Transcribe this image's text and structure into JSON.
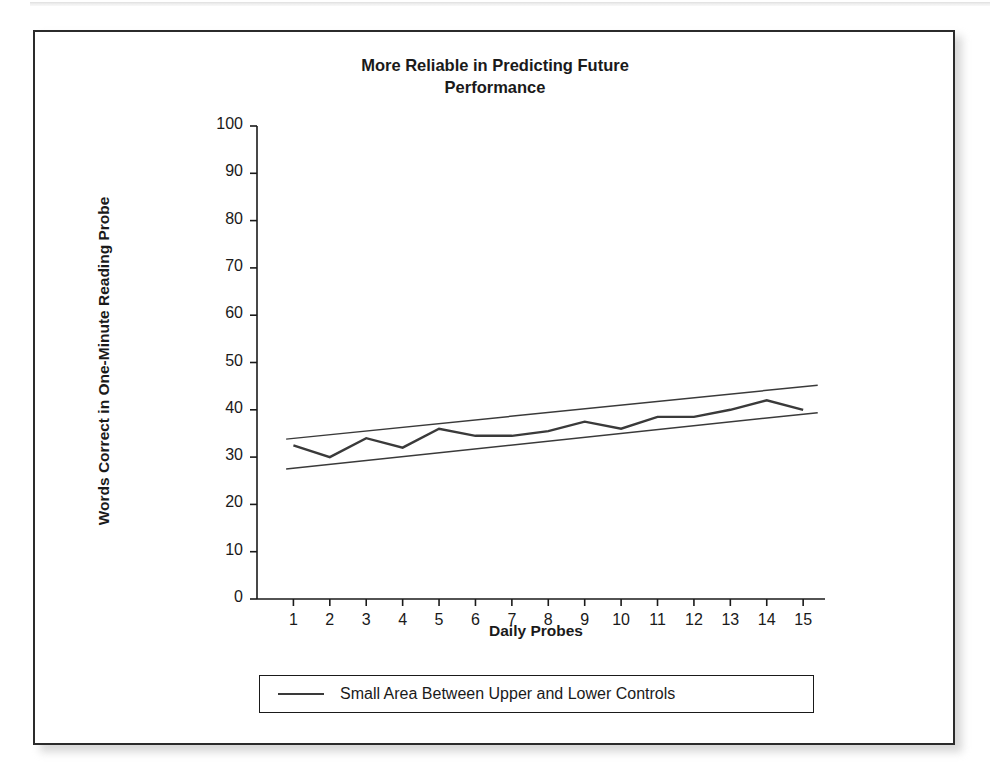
{
  "figure": {
    "title_line1": "More Reliable in Predicting Future",
    "title_line2": "Performance",
    "border_color": "#2b2b2b",
    "background": "#ffffff"
  },
  "legend": {
    "entries": [
      {
        "label": "Small Area Between Upper and Lower Controls",
        "marker": "line",
        "color": "#3a3a3a"
      }
    ]
  },
  "chart_data": {
    "type": "line",
    "title": "More Reliable in Predicting Future Performance",
    "xlabel": "Daily Probes",
    "ylabel": "Words Correct in One-Minute Reading Probe",
    "xlim": [
      0,
      15.6
    ],
    "ylim": [
      0,
      100
    ],
    "xticks": [
      1,
      2,
      3,
      4,
      5,
      6,
      7,
      8,
      9,
      10,
      11,
      12,
      13,
      14,
      15
    ],
    "xtick_labels": [
      "1",
      "2",
      "3",
      "4",
      "5",
      "6",
      "7",
      "8",
      "9",
      "10",
      "11",
      "12",
      "13",
      "14",
      "15"
    ],
    "yticks": [
      0,
      10,
      20,
      30,
      40,
      50,
      60,
      70,
      80,
      90,
      100
    ],
    "ytick_labels": [
      "0",
      "10",
      "20",
      "30",
      "40",
      "50",
      "60",
      "70",
      "80",
      "90",
      "100"
    ],
    "grid": false,
    "legend_position": "below-axes",
    "x": [
      1,
      2,
      3,
      4,
      5,
      6,
      7,
      8,
      9,
      10,
      11,
      12,
      13,
      14,
      15
    ],
    "series": [
      {
        "name": "Student Performance",
        "type": "line",
        "color": "#3a3a3a",
        "values": [
          32.5,
          30,
          34,
          32,
          36,
          34.5,
          34.5,
          35.5,
          37.5,
          36,
          38.5,
          38.5,
          40,
          42,
          40
        ]
      },
      {
        "name": "Upper Control",
        "type": "trend-line",
        "color": "#3a3a3a",
        "endpoints": [
          {
            "x": 0.8,
            "y": 33.8
          },
          {
            "x": 15.4,
            "y": 45.2
          }
        ]
      },
      {
        "name": "Lower Control",
        "type": "trend-line",
        "color": "#3a3a3a",
        "endpoints": [
          {
            "x": 0.8,
            "y": 27.5
          },
          {
            "x": 15.4,
            "y": 39.4
          }
        ]
      }
    ]
  }
}
